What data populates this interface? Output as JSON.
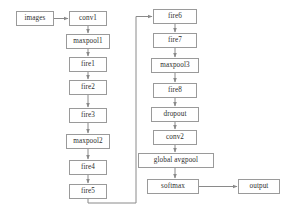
{
  "diagram": {
    "type": "flowchart",
    "background_color": "#ffffff",
    "node_border_color": "#9a9a9a",
    "node_fill_color": "#ffffff",
    "edge_color": "#8a8a8a",
    "text_color": "#2e2e2e",
    "nodes": [
      {
        "id": "images",
        "label": "images",
        "column": "left",
        "x": 16,
        "y": 11,
        "w": 38,
        "h": 15
      },
      {
        "id": "conv1",
        "label": "conv1",
        "column": "left",
        "x": 69,
        "y": 11,
        "w": 38,
        "h": 15
      },
      {
        "id": "maxpool1",
        "label": "maxpool1",
        "column": "left",
        "x": 66,
        "y": 34,
        "w": 44,
        "h": 15
      },
      {
        "id": "fire1",
        "label": "fire1",
        "column": "left",
        "x": 69,
        "y": 57,
        "w": 38,
        "h": 15
      },
      {
        "id": "fire2",
        "label": "fire2",
        "column": "left",
        "x": 69,
        "y": 80,
        "w": 38,
        "h": 15
      },
      {
        "id": "fire3",
        "label": "fire3",
        "column": "left",
        "x": 69,
        "y": 108,
        "w": 38,
        "h": 15
      },
      {
        "id": "maxpool2",
        "label": "maxpool2",
        "column": "left",
        "x": 66,
        "y": 134,
        "w": 44,
        "h": 15
      },
      {
        "id": "fire4",
        "label": "fire4",
        "column": "left",
        "x": 69,
        "y": 160,
        "w": 38,
        "h": 15
      },
      {
        "id": "fire5",
        "label": "fire5",
        "column": "left",
        "x": 69,
        "y": 184,
        "w": 38,
        "h": 15
      },
      {
        "id": "fire6",
        "label": "fire6",
        "column": "middle",
        "x": 153,
        "y": 9,
        "w": 44,
        "h": 15
      },
      {
        "id": "fire7",
        "label": "fire7",
        "column": "middle",
        "x": 153,
        "y": 33,
        "w": 44,
        "h": 15
      },
      {
        "id": "maxpool3",
        "label": "maxpool3",
        "column": "middle",
        "x": 151,
        "y": 58,
        "w": 48,
        "h": 15
      },
      {
        "id": "fire8",
        "label": "fire8",
        "column": "middle",
        "x": 153,
        "y": 83,
        "w": 44,
        "h": 15
      },
      {
        "id": "dropout",
        "label": "dropout",
        "column": "middle",
        "x": 151,
        "y": 107,
        "w": 48,
        "h": 15
      },
      {
        "id": "conv2",
        "label": "conv2",
        "column": "middle",
        "x": 153,
        "y": 130,
        "w": 44,
        "h": 15
      },
      {
        "id": "global_avgpool",
        "label": "global avgpool",
        "column": "middle",
        "x": 138,
        "y": 153,
        "w": 76,
        "h": 15
      },
      {
        "id": "softmax",
        "label": "softmax",
        "column": "middle",
        "x": 147,
        "y": 179,
        "w": 52,
        "h": 15
      },
      {
        "id": "output",
        "label": "output",
        "column": "right",
        "x": 238,
        "y": 179,
        "w": 42,
        "h": 15
      }
    ],
    "edges": [
      {
        "from": "images",
        "to": "conv1",
        "kind": "horizontal"
      },
      {
        "from": "conv1",
        "to": "maxpool1",
        "kind": "vertical"
      },
      {
        "from": "maxpool1",
        "to": "fire1",
        "kind": "vertical"
      },
      {
        "from": "fire1",
        "to": "fire2",
        "kind": "vertical"
      },
      {
        "from": "fire2",
        "to": "fire3",
        "kind": "vertical"
      },
      {
        "from": "fire3",
        "to": "maxpool2",
        "kind": "vertical"
      },
      {
        "from": "maxpool2",
        "to": "fire4",
        "kind": "vertical"
      },
      {
        "from": "fire4",
        "to": "fire5",
        "kind": "vertical"
      },
      {
        "from": "fire5",
        "to": "fire6",
        "kind": "routed-down-right-up"
      },
      {
        "from": "fire6",
        "to": "fire7",
        "kind": "vertical"
      },
      {
        "from": "fire7",
        "to": "maxpool3",
        "kind": "vertical"
      },
      {
        "from": "maxpool3",
        "to": "fire8",
        "kind": "vertical"
      },
      {
        "from": "fire8",
        "to": "dropout",
        "kind": "vertical"
      },
      {
        "from": "dropout",
        "to": "conv2",
        "kind": "vertical"
      },
      {
        "from": "conv2",
        "to": "global_avgpool",
        "kind": "vertical"
      },
      {
        "from": "global_avgpool",
        "to": "softmax",
        "kind": "vertical"
      },
      {
        "from": "softmax",
        "to": "output",
        "kind": "horizontal"
      }
    ]
  }
}
